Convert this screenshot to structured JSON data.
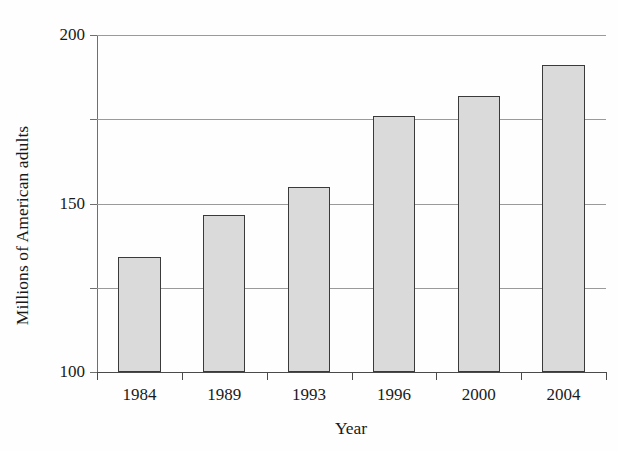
{
  "chart_data": {
    "type": "bar",
    "title": "",
    "xlabel": "Year",
    "ylabel": "Millions of American adults",
    "categories": [
      "1984",
      "1989",
      "1993",
      "1996",
      "2000",
      "2004"
    ],
    "values": [
      68,
      93,
      110,
      152,
      164,
      182
    ],
    "ylim": [
      0,
      200
    ],
    "yticks": [
      0,
      50,
      100,
      150,
      200
    ],
    "ytick_labels": [
      "0",
      "50",
      "100",
      "150",
      "200"
    ],
    "grid": "horizontal",
    "legend": null,
    "series": [
      {
        "name": "Millions of American adults",
        "values": [
          68,
          93,
          110,
          152,
          164,
          182
        ]
      }
    ],
    "colors": {
      "bar_fill": "#dadada",
      "bar_border": "#3a3a3a",
      "gridline": "#9a9a9a",
      "axis": "#4a4a4a",
      "text": "#1a1a1a",
      "background": "#fefefe"
    }
  }
}
